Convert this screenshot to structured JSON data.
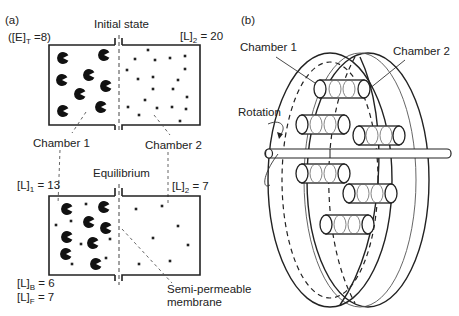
{
  "panel_a": {
    "label": "(a)",
    "initial": {
      "title": "Initial state",
      "enzyme_total": "([E]",
      "enzyme_total_sub": "T",
      "enzyme_total_val": " =8)",
      "ligand_chamber2": "[L]",
      "ligand_chamber2_sub": "2",
      "ligand_chamber2_val": " = 20",
      "chamber1_label": "Chamber 1",
      "chamber2_label": "Chamber 2",
      "enzymes": [
        [
          63,
          58
        ],
        [
          104,
          55
        ],
        [
          89,
          75
        ],
        [
          62,
          80
        ],
        [
          106,
          86
        ],
        [
          80,
          94
        ],
        [
          63,
          111
        ],
        [
          101,
          107
        ]
      ],
      "ligands": [
        [
          148,
          50
        ],
        [
          135,
          59
        ],
        [
          155,
          60
        ],
        [
          170,
          58
        ],
        [
          185,
          56
        ],
        [
          127,
          70
        ],
        [
          185,
          69
        ],
        [
          138,
          79
        ],
        [
          153,
          77
        ],
        [
          178,
          80
        ],
        [
          153,
          89
        ],
        [
          173,
          89
        ],
        [
          187,
          97
        ],
        [
          145,
          100
        ],
        [
          128,
          107
        ],
        [
          157,
          108
        ],
        [
          172,
          107
        ],
        [
          186,
          109
        ],
        [
          139,
          115
        ],
        [
          180,
          121
        ]
      ]
    },
    "equilibrium": {
      "title": "Equilibrium",
      "ligand_chamber1": "[L]",
      "ligand_chamber1_sub": "1",
      "ligand_chamber1_val": " = 13",
      "ligand_chamber2": "[L]",
      "ligand_chamber2_sub": "2",
      "ligand_chamber2_val": " = 7",
      "bound": "[L]",
      "bound_sub": "B",
      "bound_val": " = 6",
      "free": "[L]",
      "free_sub": "F",
      "free_val": " = 7",
      "membrane_label_1": "Semi-permeable",
      "membrane_label_2": "membrane",
      "enzymes": [
        [
          67,
          209
        ],
        [
          104,
          207
        ],
        [
          89,
          222
        ],
        [
          106,
          228
        ],
        [
          67,
          237
        ],
        [
          66,
          254
        ],
        [
          93,
          243
        ],
        [
          96,
          264
        ]
      ],
      "ligands": [
        [
          86,
          204
        ],
        [
          71,
          221
        ],
        [
          56,
          225
        ],
        [
          110,
          239
        ],
        [
          81,
          244
        ],
        [
          106,
          258
        ],
        [
          72,
          264
        ],
        [
          136,
          209
        ],
        [
          162,
          206
        ],
        [
          178,
          226
        ],
        [
          153,
          238
        ],
        [
          188,
          245
        ],
        [
          139,
          264
        ],
        [
          170,
          261
        ]
      ]
    }
  },
  "panel_b": {
    "label": "(b)",
    "chamber1_label": "Chamber 1",
    "chamber2_label": "Chamber 2",
    "rotation_label": "Rotation"
  }
}
